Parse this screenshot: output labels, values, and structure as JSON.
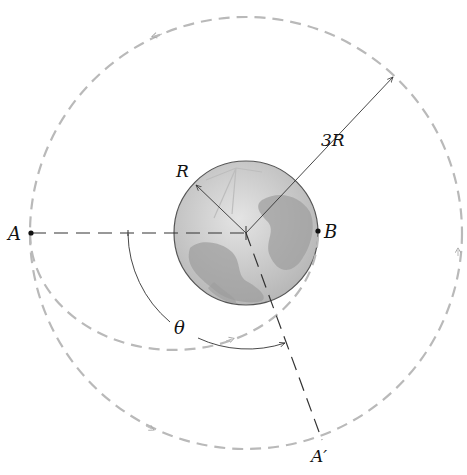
{
  "diagram": {
    "labels": {
      "point_a": "A",
      "point_b": "B",
      "point_a_prime": "A′",
      "planet_radius": "R",
      "orbit_radius": "3R",
      "angle": "θ"
    },
    "colors": {
      "orbit_dashed": "#b9b9b9",
      "construction_line": "#333333",
      "planet_fill": "#c8c8c8",
      "planet_outline": "#555555"
    },
    "geometry": {
      "center": [
        246,
        233
      ],
      "planet_radius_px": 72,
      "orbit_radius_px": 216,
      "ellipse_center": [
        174,
        233
      ],
      "ellipse_rx": 144,
      "ellipse_ry": 117
    }
  }
}
